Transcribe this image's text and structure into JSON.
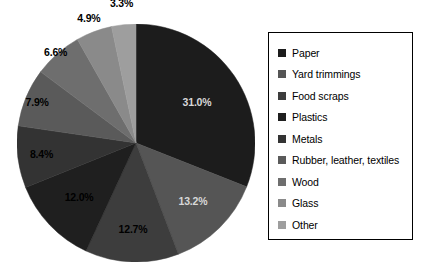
{
  "chart_data": {
    "type": "pie",
    "title": "",
    "subtitle": "",
    "xlabel": "",
    "ylabel": "",
    "legend_position": "right",
    "grid": false,
    "start_angle_deg": 0,
    "direction": "clockwise",
    "units": "percent",
    "total": "99.9%",
    "categories": [
      "Paper",
      "Yard trimmings",
      "Food scraps",
      "Plastics",
      "Metals",
      "Rubber, leather, textiles",
      "Wood",
      "Glass",
      "Other"
    ],
    "values": [
      31.0,
      13.2,
      12.7,
      12.0,
      8.4,
      7.9,
      6.6,
      4.9,
      3.3
    ],
    "data_labels": [
      "31.0%",
      "13.2%",
      "12.7%",
      "12.0%",
      "8.4%",
      "7.9%",
      "6.6%",
      "4.9%",
      "3.3%"
    ],
    "colors": [
      "#1c1c1c",
      "#555555",
      "#3d3d3d",
      "#1f1f1f",
      "#333333",
      "#5a5a5a",
      "#6e6e6e",
      "#8a8a8a",
      "#9e9e9e"
    ],
    "slices": [
      {
        "label": "Paper",
        "value": 31.0,
        "data_label": "31.0%",
        "color": "#1c1c1c"
      },
      {
        "label": "Yard trimmings",
        "value": 13.2,
        "data_label": "13.2%",
        "color": "#555555"
      },
      {
        "label": "Food scraps",
        "value": 12.7,
        "data_label": "12.7%",
        "color": "#3d3d3d"
      },
      {
        "label": "Plastics",
        "value": 12.0,
        "data_label": "12.0%",
        "color": "#1f1f1f"
      },
      {
        "label": "Metals",
        "value": 8.4,
        "data_label": "8.4%",
        "color": "#333333"
      },
      {
        "label": "Rubber, leather, textiles",
        "value": 7.9,
        "data_label": "7.9%",
        "color": "#5a5a5a"
      },
      {
        "label": "Wood",
        "value": 6.6,
        "data_label": "6.6%",
        "color": "#6e6e6e"
      },
      {
        "label": "Glass",
        "value": 4.9,
        "data_label": "4.9%",
        "color": "#8a8a8a"
      },
      {
        "label": "Other",
        "value": 3.3,
        "data_label": "3.3%",
        "color": "#9e9e9e"
      }
    ]
  },
  "legend": {
    "items": [
      {
        "label": "Paper",
        "color": "#1c1c1c"
      },
      {
        "label": "Yard trimmings",
        "color": "#555555"
      },
      {
        "label": "Food scraps",
        "color": "#3d3d3d"
      },
      {
        "label": "Plastics",
        "color": "#1f1f1f"
      },
      {
        "label": "Metals",
        "color": "#333333"
      },
      {
        "label": "Rubber, leather, textiles",
        "color": "#5a5a5a"
      },
      {
        "label": "Wood",
        "color": "#6e6e6e"
      },
      {
        "label": "Glass",
        "color": "#8a8a8a"
      },
      {
        "label": "Other",
        "color": "#9e9e9e"
      }
    ]
  }
}
